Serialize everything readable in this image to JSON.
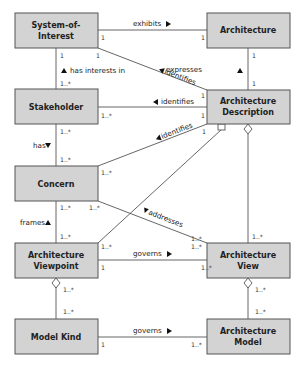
{
  "diagram": {
    "type": "uml-class-diagram",
    "boxes": {
      "system_of_interest": {
        "line1": "System-of-",
        "line2": "Interest"
      },
      "architecture": {
        "line1": "Architecture"
      },
      "stakeholder": {
        "line1": "Stakeholder"
      },
      "architecture_description": {
        "line1": "Architecture",
        "line2": "Description"
      },
      "concern": {
        "line1": "Concern"
      },
      "architecture_viewpoint": {
        "line1": "Architecture",
        "line2": "Viewpoint"
      },
      "architecture_view": {
        "line1": "Architecture",
        "line2": "View"
      },
      "model_kind": {
        "line1": "Model Kind"
      },
      "architecture_model": {
        "line1": "Architecture",
        "line2": "Model"
      }
    },
    "relations": {
      "exhibits": {
        "label": "exhibits",
        "from_mult": "1",
        "to_mult": "1"
      },
      "has_interests_in": {
        "label": "has interests in",
        "from_mult": "1",
        "to_mult": "1..*"
      },
      "identifies_soi": {
        "label": "identifies",
        "from_mult": "1",
        "to_mult": "1"
      },
      "expresses": {
        "label": "expresses",
        "from_mult": "1",
        "to_mult": "1"
      },
      "identifies_stakeholder": {
        "label": "identifies",
        "from_mult": "1..*",
        "to_mult": "1"
      },
      "has": {
        "label": "has",
        "from_mult": "1..*",
        "to_mult": "1..*"
      },
      "identifies_concern": {
        "label": "identifies",
        "from_mult": "1..*",
        "to_mult": "1"
      },
      "frames": {
        "label": "frames",
        "from_mult": "1..*",
        "to_mult": "1..*"
      },
      "addresses": {
        "label": "addresses",
        "from_mult": "1..*",
        "to_mult": "1..*"
      },
      "ad_viewpoint": {
        "to_mult": "1..*"
      },
      "ad_view": {
        "to_mult": "1..*"
      },
      "governs_view": {
        "label": "governs",
        "from_mult": "1",
        "to_mult": "1..*",
        "top_left": "1..*",
        "top_right": "1..*"
      },
      "viewpoint_modelkind": {
        "from_mult": "1..*",
        "to_mult": "1..*"
      },
      "view_model": {
        "from_mult": "1..*",
        "to_mult": "1..*"
      },
      "governs_model": {
        "label": "governs",
        "from_mult": "1",
        "to_mult": "1..*"
      }
    }
  }
}
